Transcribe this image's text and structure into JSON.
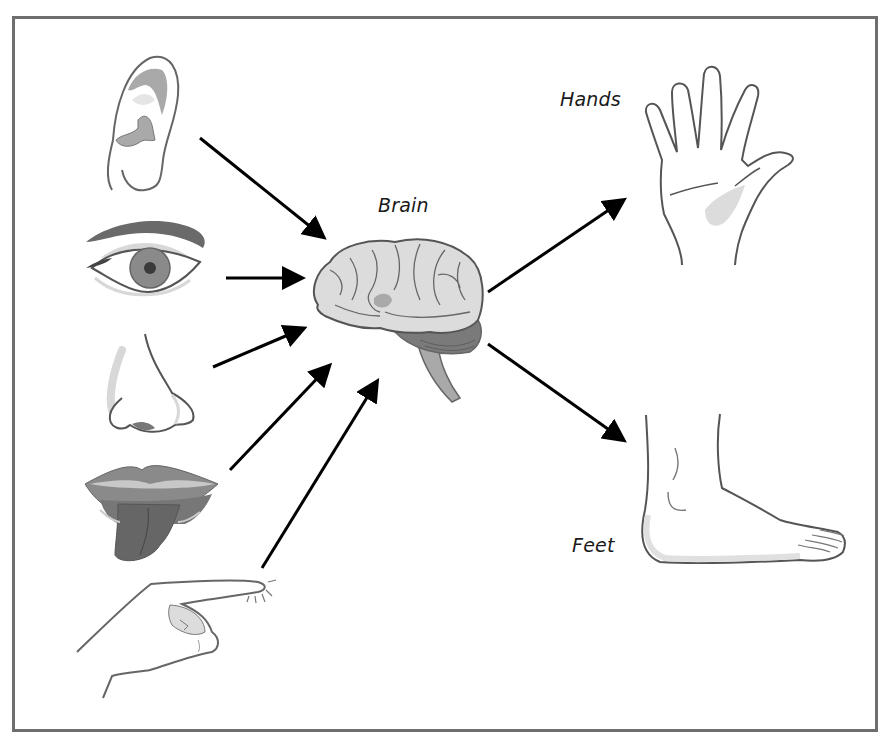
{
  "diagram": {
    "type": "sensory-motor flow",
    "labels": {
      "brain": "Brain",
      "hands": "Hands",
      "feet": "Feet"
    },
    "inputs": [
      {
        "id": "ear",
        "icon": "ear-icon"
      },
      {
        "id": "eye",
        "icon": "eye-icon"
      },
      {
        "id": "nose",
        "icon": "nose-icon"
      },
      {
        "id": "mouth",
        "icon": "mouth-tongue-icon"
      },
      {
        "id": "touch",
        "icon": "pointing-finger-icon"
      }
    ],
    "center": {
      "id": "brain",
      "icon": "brain-icon"
    },
    "outputs": [
      {
        "id": "hands",
        "icon": "hand-icon"
      },
      {
        "id": "feet",
        "icon": "foot-icon"
      }
    ],
    "arrows": [
      {
        "from": "ear",
        "to": "brain"
      },
      {
        "from": "eye",
        "to": "brain"
      },
      {
        "from": "nose",
        "to": "brain"
      },
      {
        "from": "mouth",
        "to": "brain"
      },
      {
        "from": "touch",
        "to": "brain"
      },
      {
        "from": "brain",
        "to": "hands"
      },
      {
        "from": "brain",
        "to": "feet"
      }
    ],
    "colors": {
      "frame": "#6e6e6e",
      "outline": "#555555",
      "light_fill": "#dcdcdc",
      "mid_fill": "#a9a9a9",
      "dark_fill": "#6a6a6a",
      "arrow": "#000000"
    }
  }
}
